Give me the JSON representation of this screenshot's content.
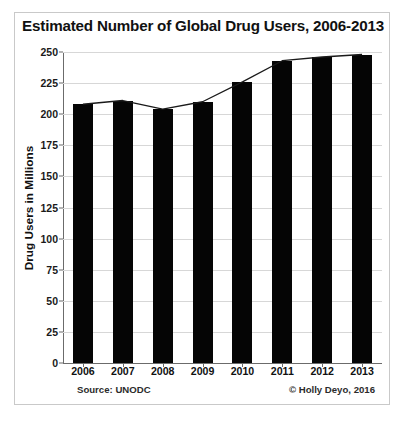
{
  "figure": {
    "title": "Estimated Number of Global Drug Users, 2006-2013",
    "source_note": "Source: UNODC",
    "credit_note": "© Holly Deyo, 2016"
  },
  "chart_data": {
    "type": "bar",
    "title": "Estimated Number of Global Drug Users, 2006-2013",
    "xlabel": "",
    "ylabel": "Drug Users in Millions",
    "categories": [
      "2006",
      "2007",
      "2008",
      "2009",
      "2010",
      "2011",
      "2012",
      "2013"
    ],
    "values": [
      208,
      211,
      204,
      210,
      226,
      243,
      246,
      248
    ],
    "series": [
      {
        "name": "Drug Users in Millions",
        "type": "bar",
        "values": [
          208,
          211,
          204,
          210,
          226,
          243,
          246,
          248
        ]
      },
      {
        "name": "Trend line",
        "type": "line",
        "values": [
          208,
          211,
          204,
          210,
          226,
          243,
          246,
          248
        ]
      }
    ],
    "ylim": [
      0,
      250
    ],
    "yticks": [
      0,
      25,
      50,
      75,
      100,
      125,
      150,
      175,
      200,
      225,
      250
    ],
    "ytick_labels": [
      "0",
      "25",
      "50",
      "75",
      "100",
      "125",
      "150",
      "175",
      "200",
      "225",
      "250"
    ],
    "grid": true,
    "legend": false,
    "bar_color": "#050505",
    "line_color": "#1a1a1a",
    "grid_color": "#d7d7d7",
    "axis_color": "#6b6b6b",
    "annotations": [
      "Source: UNODC",
      "© Holly Deyo, 2016"
    ]
  }
}
